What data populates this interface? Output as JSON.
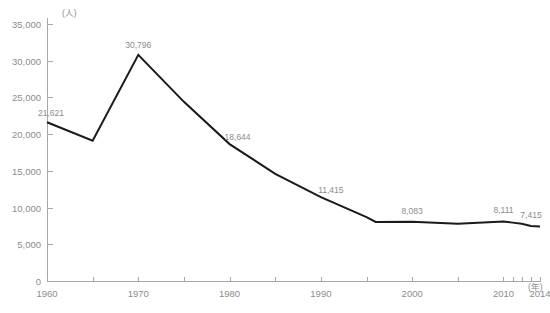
{
  "chart_data": {
    "type": "line",
    "title": "",
    "subtitle": "",
    "xlabel": "",
    "ylabel": "",
    "y_unit_label": "(人)",
    "x_unit_label": "(年)",
    "grid": false,
    "legend_position": "none",
    "xlim": [
      1960,
      2014
    ],
    "ylim": [
      0,
      35000
    ],
    "y_ticks": [
      0,
      5000,
      10000,
      15000,
      20000,
      25000,
      30000,
      35000
    ],
    "y_tick_labels": [
      "0",
      "5,000",
      "10,000",
      "15,000",
      "20,000",
      "25,000",
      "30,000",
      "35,000"
    ],
    "x_ticks": [
      1960,
      1965,
      1970,
      1975,
      1980,
      1985,
      1990,
      1995,
      2000,
      2005,
      2010,
      2011,
      2012,
      2013,
      2014
    ],
    "x_tick_labels_shown": [
      {
        "x": 1960,
        "label": "1960"
      },
      {
        "x": 1970,
        "label": "1970"
      },
      {
        "x": 1980,
        "label": "1980"
      },
      {
        "x": 1990,
        "label": "1990"
      },
      {
        "x": 2000,
        "label": "2000"
      },
      {
        "x": 2010,
        "label": "2010"
      },
      {
        "x": 2014,
        "label": "2014"
      }
    ],
    "x": [
      1960,
      1965,
      1970,
      1975,
      1980,
      1985,
      1990,
      1995,
      1996,
      2000,
      2005,
      2010,
      2011,
      2012,
      2013,
      2014
    ],
    "values": [
      21621,
      19100,
      30796,
      24400,
      18644,
      14600,
      11415,
      8700,
      8050,
      8083,
      7800,
      8111,
      7950,
      7800,
      7500,
      7415
    ],
    "annotations": [
      {
        "x": 1960,
        "y": 21621,
        "text": "21,621"
      },
      {
        "x": 1970,
        "y": 30796,
        "text": "30,796"
      },
      {
        "x": 1980,
        "y": 18644,
        "text": "18,644"
      },
      {
        "x": 1990,
        "y": 11415,
        "text": "11,415"
      },
      {
        "x": 2000,
        "y": 8083,
        "text": "8,083"
      },
      {
        "x": 2010,
        "y": 8111,
        "text": "8,111"
      },
      {
        "x": 2014,
        "y": 7415,
        "text": "7,415"
      }
    ],
    "series": [
      {
        "name": "",
        "color": "#1a1a1a",
        "values": [
          21621,
          19100,
          30796,
          24400,
          18644,
          14600,
          11415,
          8700,
          8050,
          8083,
          7800,
          8111,
          7950,
          7800,
          7500,
          7415
        ]
      }
    ],
    "colors": {
      "line": "#1a1a1a",
      "axis": "#a8a8a8",
      "text": "#8c8c8c",
      "background": "#ffffff"
    }
  }
}
